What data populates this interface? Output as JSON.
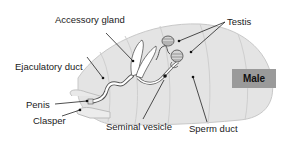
{
  "diagram": {
    "title": "Male",
    "colors": {
      "body_fill": "#e4e4e4",
      "body_stroke": "#c4c4c4",
      "organ_fill": "#ffffff",
      "organ_stroke": "#555555",
      "badge_fill": "#9a9a9a",
      "leader": "#222222"
    },
    "labels": {
      "accessory_gland": "Accessory gland",
      "testis": "Testis",
      "ejaculatory_duct": "Ejaculatory duct",
      "penis": "Penis",
      "clasper": "Clasper",
      "seminal_vesicle": "Seminal vesicle",
      "sperm_duct": "Sperm duct"
    }
  }
}
